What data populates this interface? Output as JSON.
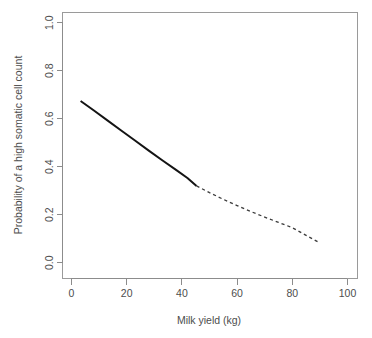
{
  "chart_data": {
    "type": "line",
    "title": "",
    "xlabel": "Milk yield (kg)",
    "ylabel": "Probability of a high somatic cell count",
    "xlim": [
      0,
      100
    ],
    "ylim": [
      0.0,
      1.0
    ],
    "xticks": [
      "0",
      "20",
      "40",
      "60",
      "80",
      "100"
    ],
    "xtick_values": [
      0,
      20,
      40,
      60,
      80,
      100
    ],
    "yticks": [
      "0.0",
      "0.2",
      "0.4",
      "0.6",
      "0.8",
      "1.0"
    ],
    "ytick_values": [
      0.0,
      0.2,
      0.4,
      0.6,
      0.8,
      1.0
    ],
    "grid": false,
    "legend": "none",
    "line_color": "#141414",
    "axis_color": "#8c8c8c",
    "background": "#ffffff",
    "series": [
      {
        "name": "observed-range-fit",
        "style": "solid",
        "x": [
          3.3,
          8,
          13,
          18,
          23,
          28,
          33,
          38,
          42,
          45.3
        ],
        "values": [
          0.674,
          0.635,
          0.593,
          0.551,
          0.509,
          0.467,
          0.426,
          0.386,
          0.353,
          0.32
        ]
      },
      {
        "name": "extrapolated-fit",
        "style": "dashed",
        "x": [
          45.3,
          50,
          55,
          60,
          65,
          70,
          75,
          80,
          85,
          90
        ],
        "values": [
          0.32,
          0.292,
          0.264,
          0.238,
          0.213,
          0.19,
          0.168,
          0.146,
          0.114,
          0.082
        ]
      }
    ]
  }
}
